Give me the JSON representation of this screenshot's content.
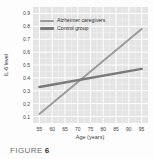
{
  "figure": {
    "caption_label": "FIGURE",
    "caption_number": "6"
  },
  "colors": {
    "plot_bg": "#e4e4e4",
    "grid_major": "#ffffff",
    "grid_minor": "rgba(255,255,255,0.45)",
    "tick_text": "#3d3d3d",
    "caregivers_line": "#9c9c9c",
    "control_line": "#7a7a7a"
  },
  "chart_data": {
    "type": "line",
    "title": "",
    "xlabel": "Age (years)",
    "ylabel": "IL-6 level",
    "x_ticks": [
      55,
      60,
      65,
      70,
      75,
      80,
      85,
      90,
      95
    ],
    "y_ticks": [
      0.1,
      0.2,
      0.3,
      0.4,
      0.5,
      0.6,
      0.7,
      0.8,
      0.9
    ],
    "xlim": [
      52.5,
      97.5
    ],
    "ylim": [
      0.05,
      0.95
    ],
    "grid": "on",
    "legend_position": "top-left-inside",
    "series": [
      {
        "name": "Alzheimer caregivers",
        "color": "#9c9c9c",
        "x": [
          55,
          95
        ],
        "values": [
          0.12,
          0.78
        ]
      },
      {
        "name": "Control group",
        "color": "#7a7a7a",
        "x": [
          55,
          95
        ],
        "values": [
          0.33,
          0.47
        ]
      }
    ]
  }
}
